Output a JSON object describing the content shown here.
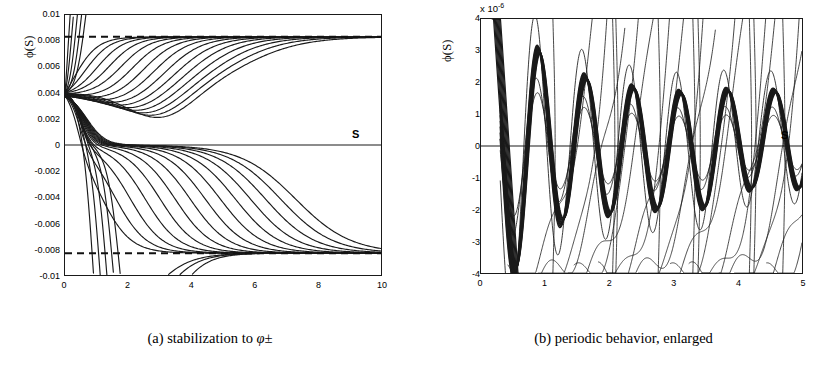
{
  "figure": {
    "panels": [
      {
        "id": "a",
        "caption_prefix": "(a)",
        "caption_text": "stabilization to",
        "caption_symbol": "φ±",
        "axis_annotation": "S",
        "ylabel": "ϕ(S)",
        "exponent_label": "",
        "chart_ref": 0
      },
      {
        "id": "b",
        "caption_prefix": "(b)",
        "caption_text": "periodic behavior, enlarged",
        "caption_symbol": "",
        "axis_annotation": "S",
        "ylabel": "ϕ(S)",
        "exponent_label": "x 10",
        "exponent_value": "-6",
        "chart_ref": 1
      }
    ]
  },
  "chart_data": [
    {
      "type": "line",
      "title": "",
      "subtitle": "",
      "xlabel": "S",
      "ylabel": "ϕ(S)",
      "xlim": [
        0,
        10
      ],
      "ylim": [
        -0.01,
        0.01
      ],
      "xticks": [
        0,
        2,
        4,
        6,
        8,
        10
      ],
      "xticklabels": [
        "0",
        "2",
        "4",
        "6",
        "8",
        "10"
      ],
      "yticks": [
        0.01,
        0.008,
        0.006,
        0.004,
        0.002,
        0,
        -0.002,
        -0.004,
        -0.006,
        -0.008,
        -0.01
      ],
      "yticklabels": [
        "0.01",
        "0.008",
        "0.006",
        "0.004",
        "0.002",
        "0",
        "-0.002",
        "-0.004",
        "-0.006",
        "-0.008",
        "-0.01"
      ],
      "grid": false,
      "legend": null,
      "annotations": [
        {
          "text": "S",
          "x": 9.35,
          "y": 0.0008,
          "style": "bold"
        }
      ],
      "reference_lines": [
        {
          "kind": "zero",
          "orientation": "horizontal",
          "y": 0,
          "style": "solid"
        },
        {
          "kind": "asymptote-plus",
          "orientation": "horizontal",
          "y": 0.00832,
          "style": "dashed"
        },
        {
          "kind": "asymptote-minus",
          "orientation": "horizontal",
          "y": -0.00832,
          "style": "dashed"
        }
      ],
      "fan_origin": {
        "x": 0,
        "y": 0.004
      },
      "asymptote_values": [
        0.00832,
        -0.00832
      ],
      "series_count": 32,
      "description": "Bundle of trajectories emanating from (0, 0.004); roughly half rise and saturate at +0.00832, half fall and saturate at -0.00832; several diverge off the bottom of the frame near S=1.5-3."
    },
    {
      "type": "line",
      "title": "",
      "subtitle": "",
      "xlabel": "S",
      "ylabel": "ϕ(S)",
      "x_scale_exponent": -6,
      "xlim": [
        0,
        5
      ],
      "ylim": [
        -4,
        4
      ],
      "xticks": [
        0,
        1,
        2,
        3,
        4,
        5
      ],
      "xticklabels": [
        "0",
        "1",
        "2",
        "3",
        "4",
        "5"
      ],
      "yticks": [
        4,
        3,
        2,
        1,
        0,
        -1,
        -2,
        -3,
        -4
      ],
      "yticklabels": [
        "4",
        "3",
        "2",
        "1",
        "0",
        "-1",
        "-2",
        "-3",
        "-4"
      ],
      "grid": false,
      "legend": null,
      "annotations": [
        {
          "text": "S",
          "x": 4.67,
          "y": 0.45,
          "style": "bold"
        }
      ],
      "reference_lines": [
        {
          "kind": "zero",
          "orientation": "horizontal",
          "y": 0,
          "style": "solid"
        }
      ],
      "envelope": {
        "period": 0.735,
        "peaks_x": [
          0.9,
          1.66,
          2.41,
          3.15,
          3.86,
          4.57
        ],
        "peaks_y": [
          3.05,
          2.15,
          1.85,
          1.7,
          1.78,
          1.75
        ],
        "troughs_x": [
          0.53,
          1.29,
          2.04,
          2.78,
          3.52,
          4.23
        ],
        "troughs_y": [
          -4.0,
          -2.35,
          -2.15,
          -2.0,
          -1.95,
          -1.35
        ]
      },
      "series_count": 18,
      "description": "Thick damped-oscillation bundle of period ~0.73 crossing zero repeatedly, surrounded by thin steeply rising curves that sweep up across the frame."
    }
  ]
}
